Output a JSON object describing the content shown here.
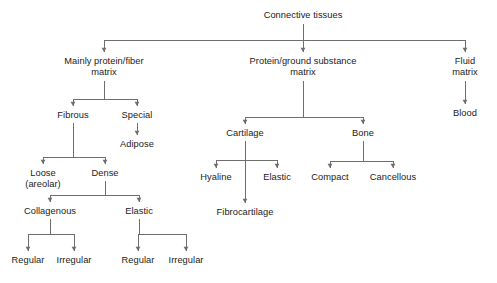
{
  "diagram": {
    "title": "Connective tissues",
    "type": "hierarchy-tree",
    "orientation": "top-down",
    "canvas": {
      "width": 497,
      "height": 283
    },
    "style": {
      "background_color": "#ffffff",
      "line_color": "#6e6e6e",
      "text_color": "#1b1b1b",
      "line_width": 1,
      "arrowheads": true
    },
    "nodes": [
      {
        "id": "connective-tissues",
        "label": "Connective tissues",
        "lines": [
          "Connective tissues"
        ],
        "x": 303,
        "y": 10,
        "level": 0
      },
      {
        "id": "mainly-protein-fiber",
        "label": "Mainly protein/fiber matrix",
        "lines": [
          "Mainly protein/fiber",
          "matrix"
        ],
        "x": 104,
        "y": 56,
        "level": 1
      },
      {
        "id": "protein-ground",
        "label": "Protein/ground substance matrix",
        "lines": [
          "Protein/ground substance",
          "matrix"
        ],
        "x": 303,
        "y": 56,
        "level": 1
      },
      {
        "id": "fluid-matrix",
        "label": "Fluid matrix",
        "lines": [
          "Fluid",
          "matrix"
        ],
        "x": 465,
        "y": 56,
        "level": 1
      },
      {
        "id": "fibrous",
        "label": "Fibrous",
        "lines": [
          "Fibrous"
        ],
        "x": 73,
        "y": 110,
        "level": 2
      },
      {
        "id": "special",
        "label": "Special",
        "lines": [
          "Special"
        ],
        "x": 137,
        "y": 110,
        "level": 2
      },
      {
        "id": "cartilage",
        "label": "Cartilage",
        "lines": [
          "Cartilage"
        ],
        "x": 245,
        "y": 128,
        "level": 2
      },
      {
        "id": "bone",
        "label": "Bone",
        "lines": [
          "Bone"
        ],
        "x": 363,
        "y": 128,
        "level": 2
      },
      {
        "id": "blood",
        "label": "Blood",
        "lines": [
          "Blood"
        ],
        "x": 465,
        "y": 108,
        "level": 2
      },
      {
        "id": "adipose",
        "label": "Adipose",
        "lines": [
          "Adipose"
        ],
        "x": 137,
        "y": 139,
        "level": 3
      },
      {
        "id": "loose-areolar",
        "label": "Loose (areolar)",
        "lines": [
          "Loose",
          "(areolar)"
        ],
        "x": 43,
        "y": 168,
        "level": 3
      },
      {
        "id": "dense",
        "label": "Dense",
        "lines": [
          "Dense"
        ],
        "x": 105,
        "y": 168,
        "level": 3
      },
      {
        "id": "hyaline",
        "label": "Hyaline",
        "lines": [
          "Hyaline"
        ],
        "x": 216,
        "y": 172,
        "level": 3
      },
      {
        "id": "elastic-cartilage",
        "label": "Elastic",
        "lines": [
          "Elastic"
        ],
        "x": 277,
        "y": 172,
        "level": 3
      },
      {
        "id": "compact",
        "label": "Compact",
        "lines": [
          "Compact"
        ],
        "x": 330,
        "y": 172,
        "level": 3
      },
      {
        "id": "cancellous",
        "label": "Cancellous",
        "lines": [
          "Cancellous"
        ],
        "x": 393,
        "y": 172,
        "level": 3
      },
      {
        "id": "fibrocartilage",
        "label": "Fibrocartilage",
        "lines": [
          "Fibrocartilage"
        ],
        "x": 245,
        "y": 207,
        "level": 4
      },
      {
        "id": "collagenous",
        "label": "Collagenous",
        "lines": [
          "Collagenous"
        ],
        "x": 50,
        "y": 206,
        "level": 4
      },
      {
        "id": "elastic-dense",
        "label": "Elastic",
        "lines": [
          "Elastic"
        ],
        "x": 139,
        "y": 206,
        "level": 4
      },
      {
        "id": "collagenous-regular",
        "label": "Regular",
        "lines": [
          "Regular"
        ],
        "x": 28,
        "y": 255,
        "level": 5
      },
      {
        "id": "collagenous-irregular",
        "label": "Irregular",
        "lines": [
          "Irregular"
        ],
        "x": 74,
        "y": 255,
        "level": 5
      },
      {
        "id": "elastic-regular",
        "label": "Regular",
        "lines": [
          "Regular"
        ],
        "x": 138,
        "y": 255,
        "level": 5
      },
      {
        "id": "elastic-irregular",
        "label": "Irregular",
        "lines": [
          "Irregular"
        ],
        "x": 186,
        "y": 255,
        "level": 5
      }
    ],
    "connectors": [
      {
        "id": "conn-root-split",
        "type": "fork",
        "from": "connective-tissues",
        "stem_x": 303,
        "stem_top": 24,
        "bar_y": 40,
        "bar_left": 104,
        "bar_right": 465,
        "drops": [
          104,
          303,
          465
        ],
        "drop_bottom": 52
      },
      {
        "id": "conn-fibrous-split",
        "type": "fork",
        "from": "mainly-protein-fiber",
        "stem_x": 104,
        "stem_top": 81,
        "bar_y": 99,
        "bar_left": 73,
        "bar_right": 137,
        "drops": [
          73,
          137
        ],
        "drop_bottom": 106
      },
      {
        "id": "conn-cartbone-split",
        "type": "fork",
        "from": "protein-ground",
        "stem_x": 303,
        "stem_top": 81,
        "bar_y": 117,
        "bar_left": 245,
        "bar_right": 363,
        "drops": [
          245,
          363
        ],
        "drop_bottom": 124
      },
      {
        "id": "conn-fluid-blood",
        "type": "stem",
        "from": "fluid-matrix",
        "stem_x": 465,
        "stem_top": 81,
        "stem_bottom": 104
      },
      {
        "id": "conn-special-adipose",
        "type": "stem",
        "from": "special",
        "stem_x": 137,
        "stem_top": 123,
        "stem_bottom": 135
      },
      {
        "id": "conn-loose-dense",
        "type": "fork",
        "from": "fibrous",
        "stem_x": 73,
        "stem_top": 123,
        "bar_y": 157,
        "bar_left": 43,
        "bar_right": 105,
        "drops": [
          43,
          105
        ],
        "drop_bottom": 164
      },
      {
        "id": "conn-hyaline-split",
        "type": "fork",
        "from": "cartilage",
        "stem_x": 245,
        "stem_top": 141,
        "bar_y": 160,
        "bar_left": 216,
        "bar_right": 277,
        "drops": [
          216,
          277
        ],
        "drop_bottom": 168
      },
      {
        "id": "conn-bone-split",
        "type": "fork",
        "from": "bone",
        "stem_x": 363,
        "stem_top": 141,
        "bar_y": 161,
        "bar_left": 330,
        "bar_right": 393,
        "drops": [
          330,
          393
        ],
        "drop_bottom": 168
      },
      {
        "id": "conn-fibrocartilage",
        "type": "stem",
        "from": "cartilage",
        "stem_x": 245,
        "stem_top": 141,
        "stem_bottom": 203
      },
      {
        "id": "conn-dense-split",
        "type": "fork",
        "from": "dense",
        "stem_x": 105,
        "stem_top": 181,
        "bar_y": 195,
        "bar_left": 50,
        "bar_right": 139,
        "drops": [
          50,
          139
        ],
        "drop_bottom": 202
      },
      {
        "id": "conn-collagenous-sub",
        "type": "fork",
        "from": "collagenous",
        "stem_x": 50,
        "stem_top": 219,
        "bar_y": 234,
        "bar_left": 28,
        "bar_right": 74,
        "drops": [
          28,
          74
        ],
        "drop_bottom": 251
      },
      {
        "id": "conn-elastic-sub",
        "type": "fork",
        "from": "elastic-dense",
        "stem_x": 139,
        "stem_top": 219,
        "bar_y": 234,
        "bar_left": 138,
        "bar_right": 186,
        "drops": [
          138,
          186
        ],
        "drop_bottom": 251
      }
    ]
  }
}
